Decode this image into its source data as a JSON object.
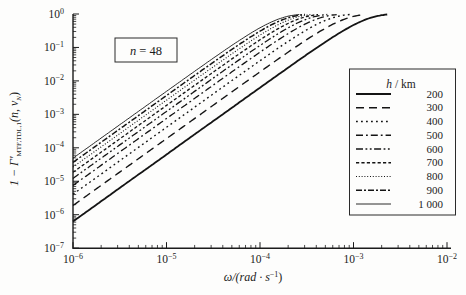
{
  "figure": {
    "annotation": {
      "var_italic": "n",
      "rest": " = 48"
    }
  },
  "axes": {
    "x": {
      "scale": "log",
      "base": "10",
      "min_exp": -6,
      "max_exp": -2,
      "tick_exponents": [
        -6,
        -5,
        -4,
        -3,
        -2
      ],
      "label_pre": "ω/(rad · s",
      "label_sup": "−1",
      "label_post": ")"
    },
    "y": {
      "scale": "log",
      "base": "10",
      "min_exp": -7,
      "max_exp": 0,
      "tick_exponents": [
        0,
        -1,
        -2,
        -3,
        -4,
        -5,
        -6,
        -7
      ],
      "label_pre": "1 − Γ′",
      "label_sub1": "MTF,TDL,1",
      "label_mid": "(n, v",
      "label_sub2": "N",
      "label_post": ")"
    }
  },
  "legend": {
    "title_italic": "h",
    "title_rest": " / km"
  },
  "chart_data": {
    "type": "line",
    "title": "",
    "xlabel": "omega / (rad s^-1)",
    "ylabel": "1 - Gamma'_MTF,TDL,1(n, v_N)",
    "annotation": "n = 48",
    "x_range": [
      1e-06,
      0.01
    ],
    "y_range": [
      1e-07,
      1
    ],
    "grid": false,
    "legend_position": "right",
    "legend_title": "h / km",
    "model": "y = 1 - exp(-k*omega^2); log-log slope 2 at small omega, saturates at 1; curves end where y ~ 0.97",
    "slope_loglog": 2,
    "saturation_level": 1,
    "series": [
      {
        "h_km": "200",
        "k": 630000,
        "value_at_omega_1e-6": 6.3e-07,
        "omega_at_saturation": 0.0024,
        "linestyle": "solid",
        "dash": "",
        "width": 1.8
      },
      {
        "h_km": "300",
        "k": 1880000,
        "value_at_omega_1e-6": 1.9e-06,
        "omega_at_saturation": 0.0014,
        "linestyle": "dashed",
        "dash": "8 5",
        "width": 1.4
      },
      {
        "h_km": "400",
        "k": 4100000,
        "value_at_omega_1e-6": 4.1e-06,
        "omega_at_saturation": 0.00092,
        "linestyle": "dotted",
        "dash": "1.8 3.2",
        "width": 1.4
      },
      {
        "h_km": "500",
        "k": 7500000,
        "value_at_omega_1e-6": 7.5e-06,
        "omega_at_saturation": 0.00068,
        "linestyle": "dash-dot",
        "dash": "7 3 1.8 3",
        "width": 1.3
      },
      {
        "h_km": "600",
        "k": 12200000,
        "value_at_omega_1e-6": 1.2e-05,
        "omega_at_saturation": 0.00054,
        "linestyle": "dash-dot-dot",
        "dash": "7 2.5 1.8 2.5 1.8 2.5",
        "width": 1.3
      },
      {
        "h_km": "700",
        "k": 18500000,
        "value_at_omega_1e-6": 1.9e-05,
        "omega_at_saturation": 0.00044,
        "linestyle": "short-dash",
        "dash": "3.2 2.2",
        "width": 1.3
      },
      {
        "h_km": "800",
        "k": 26600000,
        "value_at_omega_1e-6": 2.7e-05,
        "omega_at_saturation": 0.00036,
        "linestyle": "fine-dot",
        "dash": "1 1.8",
        "width": 1.1
      },
      {
        "h_km": "900",
        "k": 36600000,
        "value_at_omega_1e-6": 3.7e-05,
        "omega_at_saturation": 0.00031,
        "linestyle": "dash-dot-bold",
        "dash": "6 2 2 2",
        "width": 1.5
      },
      {
        "h_km": "1 000",
        "k": 48900000,
        "value_at_omega_1e-6": 4.9e-05,
        "omega_at_saturation": 0.00027,
        "linestyle": "solid-thin",
        "dash": "",
        "width": 0.9
      }
    ]
  }
}
